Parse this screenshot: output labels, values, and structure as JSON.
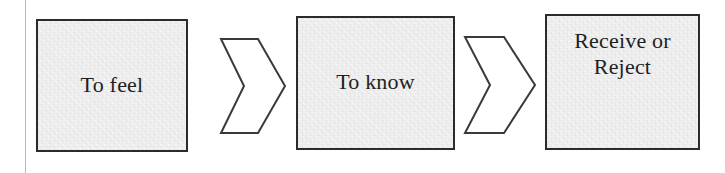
{
  "diagram": {
    "background_color": "#ffffff",
    "node_fill_color": "#eeeeee",
    "node_border_color": "#2b2b2b",
    "connector_fill_color": "#ffffff",
    "connector_stroke_color": "#3a3a3a",
    "text_color": "#1f1f1f",
    "margin_rule_color": "#b9b9b9",
    "nodes": [
      {
        "id": "feel",
        "label": "To feel",
        "shape": "rectangle"
      },
      {
        "id": "know",
        "label": "To know",
        "shape": "rectangle"
      },
      {
        "id": "result",
        "label": "Receive or\nReject",
        "shape": "rectangle"
      }
    ],
    "connectors": [
      {
        "id": "chev-1",
        "icon": "chevron-right-arrow",
        "from": "feel",
        "to": "know"
      },
      {
        "id": "chev-2",
        "icon": "chevron-right-arrow",
        "from": "know",
        "to": "result"
      }
    ]
  }
}
